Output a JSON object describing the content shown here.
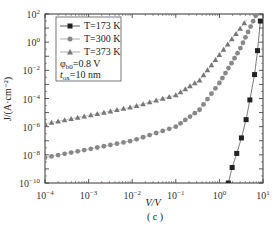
{
  "chart_data": {
    "type": "line",
    "title": "",
    "caption": "( c )",
    "xlabel": "V/V",
    "ylabel": "J/(A·cm⁻²)",
    "xscale": "log",
    "yscale": "log",
    "xlim": [
      0.0001,
      10
    ],
    "ylim": [
      1e-10,
      100
    ],
    "x_ticks": [
      "10^-4",
      "10^-3",
      "10^-2",
      "10^-1",
      "10^0",
      "10^1"
    ],
    "y_ticks": [
      "10^2",
      "10^0",
      "10^-2",
      "10^-4",
      "10^-6",
      "10^-8",
      "10^-10"
    ],
    "grid": false,
    "legend_position": "upper left",
    "annotations": [
      "φb0=0.8 V",
      "tox=10 nm"
    ],
    "series": [
      {
        "name": "T=173 K",
        "marker": "square",
        "color": "#222222",
        "x": [
          1.6,
          1.96,
          2.5,
          3.2,
          4.1,
          5.0,
          6.4,
          7.5,
          8.7
        ],
        "log10_y": [
          -10.0,
          -8.9,
          -7.9,
          -6.8,
          -5.5,
          -4.1,
          -2.3,
          -0.6,
          1.5
        ]
      },
      {
        "name": "T=300 K",
        "marker": "circle",
        "color": "#888888",
        "x": [
          0.0001,
          0.001,
          0.01,
          0.1,
          0.35,
          1.0,
          2.9,
          7.1
        ],
        "log10_y": [
          -8.2,
          -7.6,
          -7.0,
          -6.0,
          -4.8,
          -2.9,
          -0.55,
          2.0
        ]
      },
      {
        "name": "T=373 K",
        "marker": "triangle",
        "color": "#777777",
        "x": [
          0.0001,
          0.001,
          0.01,
          0.1,
          0.35,
          1.0,
          4.3
        ],
        "log10_y": [
          -5.8,
          -5.2,
          -4.6,
          -3.75,
          -2.7,
          -0.9,
          1.6
        ]
      }
    ]
  },
  "legend": {
    "items": [
      "T=173 K",
      "T=300 K",
      "T=373 K"
    ],
    "phi_label": "φ",
    "phi_sub": "b0",
    "phi_value": "=0.8 V",
    "tox_label": "t",
    "tox_sub": "ox",
    "tox_value": "=10 nm"
  },
  "axes": {
    "xlabel": "V/V",
    "ylabel": "J/(A·cm⁻²)",
    "caption": "( c )"
  }
}
